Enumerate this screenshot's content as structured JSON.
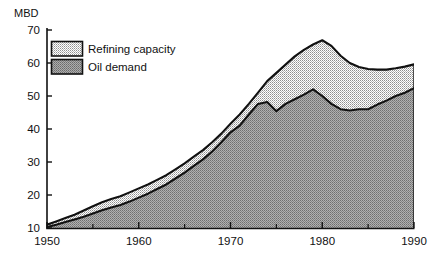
{
  "chart_data": {
    "type": "area",
    "stacked": true,
    "title": "",
    "subtitle": "",
    "xlabel": "",
    "ylabel": "MBD",
    "ylabel_position": "top-left",
    "xlim": [
      1950,
      1990
    ],
    "ylim": [
      10,
      70
    ],
    "y_ticks": [
      10,
      20,
      30,
      40,
      50,
      60,
      70
    ],
    "x_ticks": [
      1950,
      1960,
      1970,
      1980,
      1990
    ],
    "x_minor_ticks": [
      1955,
      1965,
      1975,
      1985
    ],
    "grid": false,
    "legend_position": "top-left-inside",
    "legend": [
      "Refining capacity",
      "Oil demand"
    ],
    "colors": {
      "refining_capacity_fill": "#d2d2d2",
      "oil_demand_fill": "#9a9a9a",
      "outline": "#111111",
      "axis": "#111111",
      "background": "#ffffff"
    },
    "x": [
      1950,
      1951,
      1952,
      1953,
      1954,
      1955,
      1956,
      1957,
      1958,
      1959,
      1960,
      1961,
      1962,
      1963,
      1964,
      1965,
      1966,
      1967,
      1968,
      1969,
      1970,
      1971,
      1972,
      1973,
      1974,
      1975,
      1976,
      1977,
      1978,
      1979,
      1980,
      1981,
      1982,
      1983,
      1984,
      1985,
      1986,
      1987,
      1988,
      1989,
      1990
    ],
    "series": [
      {
        "name": "Refining capacity",
        "values": [
          11.0,
          12.0,
          13.0,
          14.0,
          15.3,
          16.6,
          17.8,
          18.8,
          19.6,
          20.8,
          22.0,
          23.2,
          24.6,
          26.0,
          27.8,
          29.6,
          31.6,
          33.6,
          36.0,
          38.6,
          41.6,
          44.4,
          47.6,
          51.0,
          54.5,
          57.0,
          59.5,
          62.0,
          64.0,
          65.6,
          66.9,
          65.2,
          62.2,
          60.0,
          58.8,
          58.2,
          58.0,
          58.0,
          58.4,
          58.9,
          59.6
        ]
      },
      {
        "name": "Oil demand",
        "values": [
          10.3,
          11.0,
          11.8,
          12.6,
          13.4,
          14.4,
          15.4,
          16.2,
          17.0,
          18.0,
          19.2,
          20.4,
          21.8,
          23.2,
          25.0,
          26.8,
          28.8,
          30.8,
          33.2,
          36.0,
          39.0,
          41.0,
          44.4,
          47.6,
          48.2,
          45.4,
          47.6,
          49.0,
          50.4,
          52.0,
          50.0,
          47.6,
          46.0,
          45.6,
          46.0,
          46.0,
          47.4,
          48.6,
          50.0,
          51.0,
          52.4
        ]
      }
    ]
  },
  "axes": {
    "y_tick_labels": [
      "70",
      "60",
      "50",
      "40",
      "30",
      "20",
      "10"
    ],
    "x_tick_labels": [
      "1950",
      "1960",
      "1970",
      "1980",
      "1990"
    ],
    "unit_label": "MBD"
  },
  "legend": {
    "items": [
      {
        "label": "Refining capacity",
        "swatch": "light-hatch"
      },
      {
        "label": "Oil demand",
        "swatch": "dark-hatch"
      }
    ]
  }
}
